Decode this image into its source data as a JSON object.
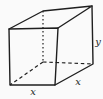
{
  "diagram": {
    "kind": "rectangular-box-wireframe",
    "labels": {
      "front_width": "x",
      "depth": "x",
      "height": "y"
    },
    "colors": {
      "stroke": "#1f1f1f",
      "background": "#fafafa"
    }
  }
}
